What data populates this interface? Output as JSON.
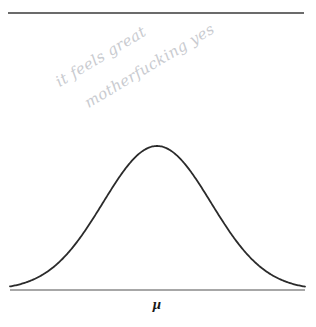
{
  "figure": {
    "kind": "hand-annotated-textbook-figure",
    "background_color": "#ffffff",
    "top_rule": {
      "name": "top-horizontal-rule",
      "color": "#6b6b6b",
      "x_start": 8,
      "x_end": 304,
      "y": 13,
      "thickness": 2
    },
    "axis": {
      "name": "baseline-axis",
      "color": "#8a8a8a",
      "x_start": 10,
      "x_end": 305,
      "y": 290,
      "thickness": 1.4
    },
    "curve": {
      "name": "normal-distribution-curve",
      "color": "#2b2b2b",
      "stroke_width": 1.8
    }
  },
  "axis_label": {
    "text": "μ",
    "name": "mu-axis-label"
  },
  "annotation": {
    "line1": "it feels great",
    "line2": "motherfucking yes",
    "color": "#c9cbd0",
    "rotation_deg": -31
  },
  "chart_data": {
    "type": "line",
    "title": "",
    "subtitle": "",
    "xlabel": "μ",
    "ylabel": "",
    "grid": false,
    "legend": null,
    "distribution": "normal",
    "mean": 157,
    "sigma": 54,
    "peak_pixel": {
      "x": 157,
      "y": 146
    },
    "baseline_pixel_y": 290,
    "amplitude_px": 144,
    "xlim": [
      10,
      305
    ],
    "ylim": [
      0,
      1
    ],
    "tick_labels": [
      "μ"
    ],
    "annotations": [
      {
        "text": "it feels great",
        "x": 57,
        "y": 74,
        "rotation": -31
      },
      {
        "text": "motherfucking yes",
        "x": 86,
        "y": 95,
        "rotation": -31
      }
    ],
    "x": [
      10,
      25,
      40,
      55,
      70,
      85,
      100,
      115,
      130,
      145,
      157,
      170,
      185,
      200,
      215,
      230,
      245,
      260,
      275,
      290,
      305
    ],
    "y": [
      0.0,
      0.002,
      0.008,
      0.028,
      0.077,
      0.172,
      0.318,
      0.51,
      0.717,
      0.899,
      1.0,
      0.97,
      0.823,
      0.621,
      0.411,
      0.24,
      0.123,
      0.055,
      0.021,
      0.007,
      0.002
    ]
  }
}
